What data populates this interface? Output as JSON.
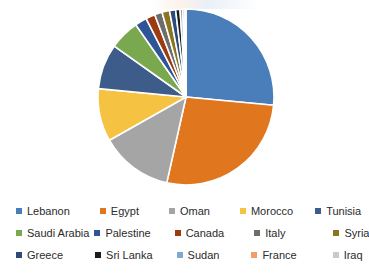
{
  "chart_data": {
    "type": "pie",
    "title": "",
    "xlabel": "",
    "ylabel": "",
    "legend_position": "bottom",
    "grid": false,
    "start_angle_deg": 0,
    "direction": "clockwise",
    "categories": [
      "Lebanon",
      "Egypt",
      "Oman",
      "Morocco",
      "Tunisia",
      "Saudi Arabia",
      "Palestine",
      "Canada",
      "Italy",
      "Syria",
      "Greece",
      "Sri Lanka",
      "Sudan",
      "France",
      "Iraq"
    ],
    "values": [
      26.5,
      27.0,
      13.3,
      9.7,
      8.3,
      5.5,
      2.2,
      1.7,
      1.4,
      1.4,
      1.1,
      0.8,
      0.5,
      0.4,
      0.2
    ],
    "value_unit": "percent",
    "colors": [
      "#4a7ebb",
      "#e0761e",
      "#a5a5a5",
      "#f5c242",
      "#3e5c8a",
      "#7aa84f",
      "#2f5597",
      "#9c3a10",
      "#6d6d6d",
      "#8a7620",
      "#2c4b7c",
      "#1b1b1b",
      "#7fa9cf",
      "#efa06a",
      "#c9c9c9"
    ],
    "slices": [
      {
        "label": "Lebanon",
        "value": 26.5,
        "color": "#4a7ebb",
        "angle_deg": 95.4
      },
      {
        "label": "Egypt",
        "value": 27.0,
        "color": "#e0761e",
        "angle_deg": 97.2
      },
      {
        "label": "Oman",
        "value": 13.3,
        "color": "#a5a5a5",
        "angle_deg": 47.9
      },
      {
        "label": "Morocco",
        "value": 9.7,
        "color": "#f5c242",
        "angle_deg": 34.9
      },
      {
        "label": "Tunisia",
        "value": 8.3,
        "color": "#3e5c8a",
        "angle_deg": 29.9
      },
      {
        "label": "Saudi Arabia",
        "value": 5.5,
        "color": "#7aa84f",
        "angle_deg": 19.8
      },
      {
        "label": "Palestine",
        "value": 2.2,
        "color": "#2f5597",
        "angle_deg": 7.9
      },
      {
        "label": "Canada",
        "value": 1.7,
        "color": "#9c3a10",
        "angle_deg": 6.1
      },
      {
        "label": "Italy",
        "value": 1.4,
        "color": "#6d6d6d",
        "angle_deg": 5.0
      },
      {
        "label": "Syria",
        "value": 1.4,
        "color": "#8a7620",
        "angle_deg": 5.0
      },
      {
        "label": "Greece",
        "value": 1.1,
        "color": "#2c4b7c",
        "angle_deg": 4.0
      },
      {
        "label": "Sri Lanka",
        "value": 0.8,
        "color": "#1b1b1b",
        "angle_deg": 2.9
      },
      {
        "label": "Sudan",
        "value": 0.5,
        "color": "#7fa9cf",
        "angle_deg": 1.8
      },
      {
        "label": "France",
        "value": 0.4,
        "color": "#efa06a",
        "angle_deg": 1.4
      },
      {
        "label": "Iraq",
        "value": 0.2,
        "color": "#c9c9c9",
        "angle_deg": 0.7
      }
    ]
  },
  "legend": {
    "rows": [
      [
        {
          "label": "Lebanon",
          "color": "#4a7ebb"
        },
        {
          "label": "Egypt",
          "color": "#e0761e"
        },
        {
          "label": "Oman",
          "color": "#a5a5a5"
        },
        {
          "label": "Morocco",
          "color": "#f5c242"
        },
        {
          "label": "Tunisia",
          "color": "#3e5c8a"
        }
      ],
      [
        {
          "label": "Saudi Arabia",
          "color": "#7aa84f"
        },
        {
          "label": "Palestine",
          "color": "#2f5597"
        },
        {
          "label": "Canada",
          "color": "#9c3a10"
        },
        {
          "label": "Italy",
          "color": "#6d6d6d"
        },
        {
          "label": "Syria",
          "color": "#8a7620"
        }
      ],
      [
        {
          "label": "Greece",
          "color": "#2c4b7c"
        },
        {
          "label": "Sri Lanka",
          "color": "#1b1b1b"
        },
        {
          "label": "Sudan",
          "color": "#7fa9cf"
        },
        {
          "label": "France",
          "color": "#efa06a"
        },
        {
          "label": "Iraq",
          "color": "#c9c9c9"
        }
      ]
    ],
    "column_offsets_px": [
      0,
      86,
      162,
      238,
      316
    ]
  },
  "geometry": {
    "center_x": 186,
    "center_y": 97,
    "radius": 88,
    "separator_color": "#ffffff",
    "separator_width": 1.6
  }
}
